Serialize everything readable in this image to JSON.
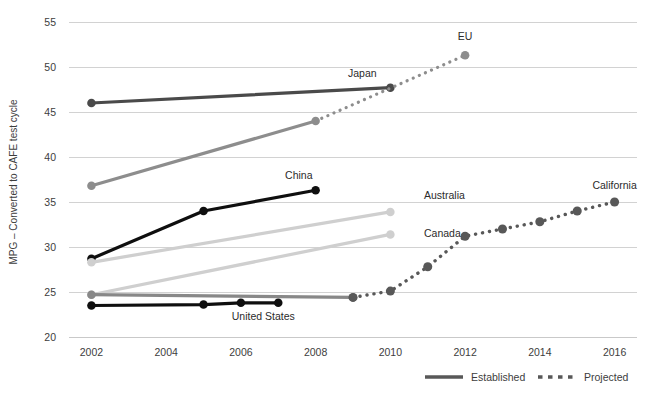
{
  "chart_data": {
    "type": "line",
    "title": "",
    "xlabel": "",
    "ylabel": "MPG – Converted to CAFE test cycle",
    "xlim": [
      2001.4,
      2016.6
    ],
    "ylim": [
      20,
      55
    ],
    "x_ticks": [
      "2002",
      "2004",
      "2006",
      "2008",
      "2010",
      "2012",
      "2014",
      "2016"
    ],
    "x_tick_values": [
      2002,
      2004,
      2006,
      2008,
      2010,
      2012,
      2014,
      2016
    ],
    "y_ticks": [
      "20",
      "25",
      "30",
      "35",
      "40",
      "45",
      "50",
      "55"
    ],
    "y_tick_values": [
      20,
      25,
      30,
      35,
      40,
      45,
      50,
      55
    ],
    "grid": true,
    "legend_position": "bottom-right",
    "series": [
      {
        "name": "Japan",
        "label": "Japan",
        "color": "#4a4a4a",
        "style": "established",
        "width": 3.2,
        "label_x": 2009.25,
        "label_y": 48.9,
        "label_anchor": "middle",
        "markers": [
          true,
          true
        ],
        "x": [
          2002,
          2010
        ],
        "y": [
          46.0,
          47.7
        ]
      },
      {
        "name": "EU",
        "label": "EU",
        "color": "#8d8d8d",
        "style": "established",
        "width": 3.2,
        "label_x": 2012.0,
        "label_y": 53.0,
        "label_anchor": "middle",
        "markers": [
          true,
          true
        ],
        "x": [
          2002,
          2008
        ],
        "y": [
          36.8,
          44.0
        ]
      },
      {
        "name": "EU projected",
        "label": "",
        "color": "#8d8d8d",
        "style": "projected",
        "width": 3.2,
        "label_x": 0,
        "label_y": 0,
        "label_anchor": "middle",
        "markers": [
          false,
          true
        ],
        "x": [
          2008,
          2012
        ],
        "y": [
          44.0,
          51.3
        ]
      },
      {
        "name": "China",
        "label": "China",
        "color": "#0f0f0f",
        "style": "established",
        "width": 3.2,
        "label_x": 2007.55,
        "label_y": 37.6,
        "label_anchor": "middle",
        "markers": [
          true,
          true,
          true
        ],
        "x": [
          2002,
          2005,
          2008
        ],
        "y": [
          28.7,
          34.0,
          36.3
        ]
      },
      {
        "name": "Australia",
        "label": "Australia",
        "color": "#cfcfcf",
        "style": "established",
        "width": 3.2,
        "label_x": 2010.9,
        "label_y": 35.3,
        "label_anchor": "start",
        "markers": [
          true,
          true
        ],
        "x": [
          2002,
          2010
        ],
        "y": [
          28.3,
          33.9
        ]
      },
      {
        "name": "Canada",
        "label": "Canada",
        "color": "#cfcfcf",
        "style": "established",
        "width": 3.2,
        "label_x": 2010.9,
        "label_y": 31.1,
        "label_anchor": "start",
        "markers": [
          true,
          true
        ],
        "x": [
          2002,
          2010
        ],
        "y": [
          24.7,
          31.4
        ]
      },
      {
        "name": "California",
        "label": "California",
        "color": "#888888",
        "style": "established",
        "width": 3.2,
        "label_x": 2016.0,
        "label_y": 36.5,
        "label_anchor": "middle",
        "markers": [
          true,
          true
        ],
        "x": [
          2002,
          2009
        ],
        "y": [
          24.7,
          24.4
        ]
      },
      {
        "name": "California projected",
        "label": "",
        "color": "#585858",
        "style": "projected",
        "width": 3.4,
        "label_x": 0,
        "label_y": 0,
        "label_anchor": "middle",
        "markers": [
          true,
          true,
          true,
          true,
          true,
          true,
          true,
          true
        ],
        "x": [
          2009,
          2010,
          2011,
          2012,
          2013,
          2014,
          2015,
          2016
        ],
        "y": [
          24.4,
          25.1,
          27.8,
          31.2,
          32.0,
          32.8,
          34.0,
          35.0
        ]
      },
      {
        "name": "United States",
        "label": "United States",
        "color": "#0f0f0f",
        "style": "established",
        "width": 3.2,
        "label_x": 2006.6,
        "label_y": 21.9,
        "label_anchor": "middle",
        "markers": [
          true,
          true,
          true,
          true
        ],
        "x": [
          2002,
          2005,
          2006,
          2007
        ],
        "y": [
          23.5,
          23.6,
          23.8,
          23.8
        ]
      }
    ],
    "legend": [
      {
        "label": "Established",
        "style": "established",
        "color": "#585858"
      },
      {
        "label": "Projected",
        "style": "projected",
        "color": "#585858"
      }
    ]
  }
}
